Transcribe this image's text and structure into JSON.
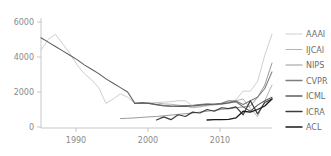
{
  "chart_data": {
    "type": "line",
    "title": "",
    "subtitle": "",
    "xlabel": "",
    "ylabel": "",
    "xlim": [
      1984,
      2016
    ],
    "ylim": [
      0,
      6000
    ],
    "grid": false,
    "legend_position": "right",
    "x_ticks": [
      "1990",
      "2000",
      "2010"
    ],
    "x_tick_values": [
      1990,
      2000,
      2010
    ],
    "y_ticks": [
      "0",
      "2000",
      "4000",
      "6000"
    ],
    "y_tick_values": [
      0,
      2000,
      4000,
      6000
    ],
    "series": [
      {
        "name": "AAAI",
        "color": "#cfcfcf",
        "x": [
          1984,
          1985,
          1986,
          1987,
          1988,
          1989,
          1990,
          1991,
          1992,
          1993,
          1994,
          1995,
          1996,
          1997,
          1998,
          1999,
          2000,
          2001,
          2002,
          2003,
          2004,
          2005,
          2006,
          2007,
          2008,
          2009,
          2010,
          2011,
          2012,
          2013,
          2014,
          2015,
          2016
        ],
        "values": [
          4400,
          5000,
          5300,
          4750,
          4200,
          3550,
          3050,
          2700,
          2250,
          1350,
          1600,
          1900,
          1700,
          1350,
          1350,
          1380,
          1400,
          1420,
          1450,
          1500,
          1500,
          1200,
          1150,
          1200,
          1250,
          1300,
          1350,
          1550,
          2050,
          2050,
          2600,
          4100,
          5300
        ]
      },
      {
        "name": "IJCAI",
        "color": "#b4b4b4",
        "x": [
          2000,
          2001,
          2002,
          2003,
          2004,
          2005,
          2006,
          2007,
          2008,
          2009,
          2010,
          2011,
          2012,
          2013,
          2014,
          2015,
          2016
        ],
        "values": [
          1380,
          1320,
          1300,
          1250,
          1200,
          1100,
          1150,
          1250,
          1300,
          1320,
          1400,
          1500,
          1600,
          1050,
          600,
          1500,
          2400
        ]
      },
      {
        "name": "NIPS",
        "color": "#9a9a9a",
        "x": [
          1995,
          1996,
          1997,
          1998,
          1999,
          2000,
          2001,
          2002,
          2003,
          2004,
          2005,
          2006,
          2007,
          2008,
          2009,
          2010,
          2011,
          2012,
          2013,
          2014,
          2015,
          2016
        ],
        "values": [
          480,
          500,
          520,
          550,
          580,
          600,
          640,
          680,
          720,
          760,
          800,
          850,
          900,
          950,
          1000,
          1050,
          1100,
          1150,
          1200,
          1700,
          2400,
          3650
        ]
      },
      {
        "name": "CVPR",
        "color": "#7e7e7e",
        "x": [
          1997,
          1998,
          1999,
          2000,
          2001,
          2002,
          2003,
          2004,
          2005,
          2006,
          2007,
          2008,
          2009,
          2010,
          2011,
          2012,
          2013,
          2014,
          2015,
          2016
        ],
        "values": [
          1350,
          1380,
          1350,
          1280,
          1200,
          1180,
          1200,
          1220,
          1240,
          1280,
          1320,
          1300,
          1350,
          1500,
          1480,
          1280,
          1500,
          1700,
          2200,
          3150
        ]
      },
      {
        "name": "ICML",
        "color": "#5f5f5f",
        "x": [
          1984,
          1985,
          1986,
          1987,
          1988,
          1989,
          1990,
          1991,
          1992,
          1993,
          1994,
          1995,
          1996,
          1997,
          1998,
          1999,
          2000,
          2001,
          2002,
          2003,
          2004,
          2005,
          2006,
          2007,
          2008,
          2009,
          2010,
          2011,
          2012,
          2013,
          2014,
          2015,
          2016
        ],
        "values": [
          5100,
          4850,
          4600,
          4350,
          4100,
          3850,
          3550,
          3300,
          3050,
          2750,
          2500,
          2250,
          2000,
          1350,
          1380,
          1350,
          1280,
          1230,
          1200,
          1180,
          1180,
          1200,
          1250,
          1280,
          1300,
          1320,
          1380,
          1450,
          1150,
          900,
          1250,
          1500,
          1700
        ]
      },
      {
        "name": "ICRA",
        "color": "#3d3d3d",
        "x": [
          2000,
          2001,
          2002,
          2003,
          2004,
          2005,
          2006,
          2007,
          2008,
          2009,
          2010,
          2011,
          2012,
          2013,
          2014,
          2015,
          2016
        ],
        "values": [
          400,
          580,
          420,
          700,
          600,
          850,
          800,
          1000,
          900,
          1100,
          1050,
          1150,
          700,
          1500,
          750,
          1400,
          1600
        ]
      },
      {
        "name": "ACL",
        "color": "#1a1a1a",
        "x": [
          2007,
          2008,
          2009,
          2010,
          2011,
          2012,
          2013,
          2014,
          2015,
          2016
        ],
        "values": [
          400,
          420,
          420,
          430,
          520,
          900,
          850,
          1000,
          1200,
          1600
        ]
      }
    ]
  },
  "legend": {
    "items": [
      {
        "label": "AAAI",
        "color": "#cfcfcf"
      },
      {
        "label": "IJCAI",
        "color": "#b4b4b4"
      },
      {
        "label": "NIPS",
        "color": "#9a9a9a"
      },
      {
        "label": "CVPR",
        "color": "#7e7e7e"
      },
      {
        "label": "ICML",
        "color": "#5f5f5f"
      },
      {
        "label": "ICRA",
        "color": "#3d3d3d"
      },
      {
        "label": "ACL",
        "color": "#1a1a1a"
      }
    ]
  },
  "axes": {
    "x_tick_labels": [
      "1990",
      "2000",
      "2010"
    ],
    "y_tick_labels": [
      "6000",
      "4000",
      "2000",
      "0"
    ],
    "axis_color": "#b9b9b9",
    "tick_text_color": "#8a8a8a"
  },
  "style": {
    "background": "#ffffff"
  }
}
